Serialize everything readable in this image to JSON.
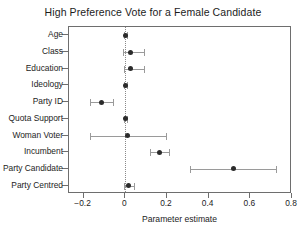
{
  "chart_data": {
    "type": "scatter",
    "title": "High Preference Vote for a Female Candidate",
    "xlabel": "Parameter estimate",
    "ylabel": "",
    "xlim": [
      -0.27,
      0.8
    ],
    "xticks": [
      -0.2,
      0,
      0.2,
      0.4,
      0.6,
      0.8
    ],
    "xticklabels": [
      "−0.2",
      "0",
      "0.2",
      "0.4",
      "0.6",
      "0.8"
    ],
    "grid": false,
    "legend": null,
    "reference_line": 0,
    "reference_line_style": "dotted",
    "categories": [
      "Age",
      "Class",
      "Education",
      "Ideology",
      "Party ID",
      "Quota Support",
      "Woman Voter",
      "Incumbent",
      "Party Candidate",
      "Party Centred"
    ],
    "estimates": [
      0.002,
      0.025,
      0.027,
      0.0,
      -0.115,
      0.0,
      0.01,
      0.165,
      0.52,
      0.015
    ],
    "ci_low": [
      -0.004,
      -0.01,
      -0.008,
      -0.004,
      -0.17,
      -0.004,
      -0.17,
      0.12,
      0.31,
      -0.004
    ],
    "ci_high": [
      0.008,
      0.092,
      0.09,
      0.008,
      -0.06,
      0.008,
      0.195,
      0.21,
      0.722,
      0.04
    ],
    "marker_color": "#2b2b2b",
    "errorbar_color": "#9a9a9a",
    "points": [
      {
        "label": "Age",
        "estimate": 0.002,
        "ci_low": -0.004,
        "ci_high": 0.008
      },
      {
        "label": "Class",
        "estimate": 0.025,
        "ci_low": -0.01,
        "ci_high": 0.092
      },
      {
        "label": "Education",
        "estimate": 0.027,
        "ci_low": -0.008,
        "ci_high": 0.09
      },
      {
        "label": "Ideology",
        "estimate": 0.0,
        "ci_low": -0.004,
        "ci_high": 0.008
      },
      {
        "label": "Party ID",
        "estimate": -0.115,
        "ci_low": -0.17,
        "ci_high": -0.06
      },
      {
        "label": "Quota Support",
        "estimate": 0.0,
        "ci_low": -0.004,
        "ci_high": 0.008
      },
      {
        "label": "Woman Voter",
        "estimate": 0.01,
        "ci_low": -0.17,
        "ci_high": 0.195
      },
      {
        "label": "Incumbent",
        "estimate": 0.165,
        "ci_low": 0.12,
        "ci_high": 0.21
      },
      {
        "label": "Party Candidate",
        "estimate": 0.52,
        "ci_low": 0.31,
        "ci_high": 0.722
      },
      {
        "label": "Party Centred",
        "estimate": 0.015,
        "ci_low": -0.004,
        "ci_high": 0.04
      }
    ]
  }
}
